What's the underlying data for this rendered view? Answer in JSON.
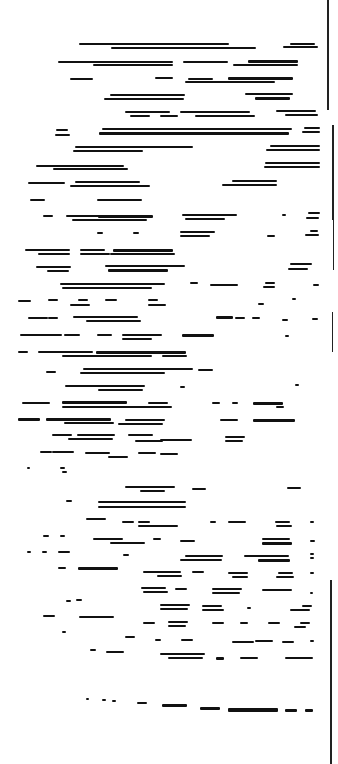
{
  "document": {
    "description": "Degraded thresholded scan of a text page; no legible characters",
    "legible_text": "",
    "ink_color": "#111111",
    "paper_color": "#ffffff"
  },
  "edge_lines": [
    {
      "x": 327,
      "y": 0,
      "w": 1.5,
      "h": 110
    },
    {
      "x": 332,
      "y": 125,
      "w": 1.5,
      "h": 95
    },
    {
      "x": 333,
      "y": 210,
      "w": 1.2,
      "h": 60
    },
    {
      "x": 332,
      "y": 312,
      "w": 1.2,
      "h": 40
    },
    {
      "x": 330,
      "y": 580,
      "w": 1.5,
      "h": 184
    }
  ],
  "segments": [
    {
      "x": 79,
      "y": 43,
      "w": 150,
      "h": 2
    },
    {
      "x": 111,
      "y": 47,
      "w": 145,
      "h": 2
    },
    {
      "x": 290,
      "y": 43,
      "w": 25,
      "h": 2
    },
    {
      "x": 283,
      "y": 46,
      "w": 35,
      "h": 2
    },
    {
      "x": 58,
      "y": 61,
      "w": 115,
      "h": 2
    },
    {
      "x": 93,
      "y": 64,
      "w": 80,
      "h": 2
    },
    {
      "x": 183,
      "y": 61,
      "w": 45,
      "h": 2
    },
    {
      "x": 248,
      "y": 60,
      "w": 50,
      "h": 3
    },
    {
      "x": 233,
      "y": 64,
      "w": 65,
      "h": 2
    },
    {
      "x": 70,
      "y": 78,
      "w": 23,
      "h": 2
    },
    {
      "x": 155,
      "y": 77,
      "w": 18,
      "h": 2
    },
    {
      "x": 188,
      "y": 78,
      "w": 25,
      "h": 2
    },
    {
      "x": 228,
      "y": 77,
      "w": 65,
      "h": 3
    },
    {
      "x": 185,
      "y": 81,
      "w": 90,
      "h": 2
    },
    {
      "x": 110,
      "y": 94,
      "w": 75,
      "h": 2
    },
    {
      "x": 104,
      "y": 98,
      "w": 80,
      "h": 2
    },
    {
      "x": 245,
      "y": 93,
      "w": 48,
      "h": 2
    },
    {
      "x": 255,
      "y": 97,
      "w": 35,
      "h": 3
    },
    {
      "x": 125,
      "y": 111,
      "w": 45,
      "h": 2
    },
    {
      "x": 130,
      "y": 115,
      "w": 20,
      "h": 2
    },
    {
      "x": 160,
      "y": 115,
      "w": 18,
      "h": 2
    },
    {
      "x": 180,
      "y": 111,
      "w": 70,
      "h": 2
    },
    {
      "x": 195,
      "y": 115,
      "w": 60,
      "h": 2
    },
    {
      "x": 276,
      "y": 110,
      "w": 40,
      "h": 2
    },
    {
      "x": 285,
      "y": 114,
      "w": 33,
      "h": 2
    },
    {
      "x": 102,
      "y": 128,
      "w": 190,
      "h": 2
    },
    {
      "x": 99,
      "y": 132,
      "w": 190,
      "h": 3
    },
    {
      "x": 56,
      "y": 129,
      "w": 12,
      "h": 2
    },
    {
      "x": 55,
      "y": 134,
      "w": 15,
      "h": 2
    },
    {
      "x": 304,
      "y": 127,
      "w": 16,
      "h": 2
    },
    {
      "x": 302,
      "y": 131,
      "w": 18,
      "h": 2
    },
    {
      "x": 75,
      "y": 146,
      "w": 118,
      "h": 2
    },
    {
      "x": 73,
      "y": 150,
      "w": 70,
      "h": 2
    },
    {
      "x": 270,
      "y": 145,
      "w": 50,
      "h": 2
    },
    {
      "x": 266,
      "y": 149,
      "w": 54,
      "h": 2
    },
    {
      "x": 36,
      "y": 165,
      "w": 88,
      "h": 2
    },
    {
      "x": 53,
      "y": 168,
      "w": 75,
      "h": 2
    },
    {
      "x": 265,
      "y": 162,
      "w": 55,
      "h": 2
    },
    {
      "x": 264,
      "y": 166,
      "w": 56,
      "h": 2
    },
    {
      "x": 28,
      "y": 182,
      "w": 37,
      "h": 2
    },
    {
      "x": 75,
      "y": 181,
      "w": 65,
      "h": 2
    },
    {
      "x": 70,
      "y": 185,
      "w": 80,
      "h": 2
    },
    {
      "x": 232,
      "y": 180,
      "w": 45,
      "h": 2
    },
    {
      "x": 222,
      "y": 184,
      "w": 55,
      "h": 2
    },
    {
      "x": 30,
      "y": 199,
      "w": 15,
      "h": 2
    },
    {
      "x": 97,
      "y": 199,
      "w": 45,
      "h": 2
    },
    {
      "x": 43,
      "y": 215,
      "w": 10,
      "h": 2
    },
    {
      "x": 66,
      "y": 215,
      "w": 35,
      "h": 2
    },
    {
      "x": 98,
      "y": 215,
      "w": 55,
      "h": 3
    },
    {
      "x": 72,
      "y": 219,
      "w": 75,
      "h": 2
    },
    {
      "x": 182,
      "y": 214,
      "w": 55,
      "h": 2
    },
    {
      "x": 185,
      "y": 218,
      "w": 40,
      "h": 2
    },
    {
      "x": 282,
      "y": 214,
      "w": 4,
      "h": 2
    },
    {
      "x": 308,
      "y": 212,
      "w": 12,
      "h": 2
    },
    {
      "x": 306,
      "y": 217,
      "w": 13,
      "h": 2
    },
    {
      "x": 97,
      "y": 232,
      "w": 6,
      "h": 2
    },
    {
      "x": 133,
      "y": 232,
      "w": 6,
      "h": 2
    },
    {
      "x": 180,
      "y": 231,
      "w": 35,
      "h": 2
    },
    {
      "x": 180,
      "y": 235,
      "w": 30,
      "h": 2
    },
    {
      "x": 267,
      "y": 235,
      "w": 8,
      "h": 2
    },
    {
      "x": 310,
      "y": 230,
      "w": 8,
      "h": 2
    },
    {
      "x": 305,
      "y": 234,
      "w": 14,
      "h": 2
    },
    {
      "x": 25,
      "y": 249,
      "w": 45,
      "h": 2
    },
    {
      "x": 38,
      "y": 253,
      "w": 32,
      "h": 2
    },
    {
      "x": 80,
      "y": 249,
      "w": 25,
      "h": 2
    },
    {
      "x": 80,
      "y": 253,
      "w": 30,
      "h": 2
    },
    {
      "x": 113,
      "y": 249,
      "w": 60,
      "h": 3
    },
    {
      "x": 110,
      "y": 253,
      "w": 65,
      "h": 2
    },
    {
      "x": 36,
      "y": 266,
      "w": 35,
      "h": 2
    },
    {
      "x": 47,
      "y": 270,
      "w": 22,
      "h": 2
    },
    {
      "x": 105,
      "y": 265,
      "w": 80,
      "h": 2
    },
    {
      "x": 108,
      "y": 269,
      "w": 60,
      "h": 3
    },
    {
      "x": 290,
      "y": 263,
      "w": 22,
      "h": 2
    },
    {
      "x": 288,
      "y": 268,
      "w": 20,
      "h": 2
    },
    {
      "x": 60,
      "y": 283,
      "w": 105,
      "h": 2
    },
    {
      "x": 62,
      "y": 287,
      "w": 90,
      "h": 2
    },
    {
      "x": 190,
      "y": 282,
      "w": 8,
      "h": 2
    },
    {
      "x": 210,
      "y": 284,
      "w": 28,
      "h": 2
    },
    {
      "x": 265,
      "y": 282,
      "w": 10,
      "h": 2
    },
    {
      "x": 263,
      "y": 286,
      "w": 12,
      "h": 2
    },
    {
      "x": 313,
      "y": 284,
      "w": 6,
      "h": 2
    },
    {
      "x": 18,
      "y": 300,
      "w": 13,
      "h": 2
    },
    {
      "x": 48,
      "y": 299,
      "w": 10,
      "h": 2
    },
    {
      "x": 78,
      "y": 299,
      "w": 10,
      "h": 2
    },
    {
      "x": 105,
      "y": 299,
      "w": 12,
      "h": 2
    },
    {
      "x": 148,
      "y": 299,
      "w": 10,
      "h": 2
    },
    {
      "x": 70,
      "y": 304,
      "w": 20,
      "h": 2
    },
    {
      "x": 148,
      "y": 304,
      "w": 18,
      "h": 2
    },
    {
      "x": 292,
      "y": 298,
      "w": 4,
      "h": 2
    },
    {
      "x": 258,
      "y": 303,
      "w": 6,
      "h": 2
    },
    {
      "x": 28,
      "y": 317,
      "w": 20,
      "h": 2
    },
    {
      "x": 48,
      "y": 317,
      "w": 10,
      "h": 2
    },
    {
      "x": 73,
      "y": 316,
      "w": 65,
      "h": 2
    },
    {
      "x": 86,
      "y": 320,
      "w": 55,
      "h": 2
    },
    {
      "x": 216,
      "y": 316,
      "w": 17,
      "h": 3
    },
    {
      "x": 235,
      "y": 317,
      "w": 10,
      "h": 2
    },
    {
      "x": 252,
      "y": 317,
      "w": 8,
      "h": 2
    },
    {
      "x": 282,
      "y": 319,
      "w": 6,
      "h": 2
    },
    {
      "x": 312,
      "y": 318,
      "w": 6,
      "h": 2
    },
    {
      "x": 20,
      "y": 334,
      "w": 42,
      "h": 2
    },
    {
      "x": 64,
      "y": 334,
      "w": 16,
      "h": 2
    },
    {
      "x": 97,
      "y": 334,
      "w": 15,
      "h": 2
    },
    {
      "x": 122,
      "y": 334,
      "w": 40,
      "h": 2
    },
    {
      "x": 182,
      "y": 334,
      "w": 32,
      "h": 3
    },
    {
      "x": 122,
      "y": 338,
      "w": 30,
      "h": 2
    },
    {
      "x": 285,
      "y": 335,
      "w": 4,
      "h": 2
    },
    {
      "x": 18,
      "y": 351,
      "w": 10,
      "h": 2
    },
    {
      "x": 38,
      "y": 351,
      "w": 55,
      "h": 2
    },
    {
      "x": 96,
      "y": 351,
      "w": 90,
      "h": 3
    },
    {
      "x": 62,
      "y": 355,
      "w": 90,
      "h": 2
    },
    {
      "x": 162,
      "y": 355,
      "w": 25,
      "h": 2
    },
    {
      "x": 46,
      "y": 371,
      "w": 10,
      "h": 2
    },
    {
      "x": 83,
      "y": 368,
      "w": 110,
      "h": 2
    },
    {
      "x": 80,
      "y": 372,
      "w": 85,
      "h": 2
    },
    {
      "x": 198,
      "y": 369,
      "w": 15,
      "h": 2
    },
    {
      "x": 65,
      "y": 385,
      "w": 80,
      "h": 2
    },
    {
      "x": 98,
      "y": 389,
      "w": 45,
      "h": 2
    },
    {
      "x": 180,
      "y": 386,
      "w": 5,
      "h": 2
    },
    {
      "x": 295,
      "y": 384,
      "w": 4,
      "h": 2
    },
    {
      "x": 22,
      "y": 402,
      "w": 28,
      "h": 2
    },
    {
      "x": 62,
      "y": 401,
      "w": 65,
      "h": 3
    },
    {
      "x": 62,
      "y": 406,
      "w": 110,
      "h": 2
    },
    {
      "x": 148,
      "y": 402,
      "w": 20,
      "h": 2
    },
    {
      "x": 212,
      "y": 402,
      "w": 8,
      "h": 2
    },
    {
      "x": 232,
      "y": 402,
      "w": 6,
      "h": 2
    },
    {
      "x": 253,
      "y": 402,
      "w": 30,
      "h": 3
    },
    {
      "x": 276,
      "y": 406,
      "w": 8,
      "h": 2
    },
    {
      "x": 18,
      "y": 418,
      "w": 22,
      "h": 3
    },
    {
      "x": 46,
      "y": 418,
      "w": 65,
      "h": 3
    },
    {
      "x": 64,
      "y": 422,
      "w": 50,
      "h": 2
    },
    {
      "x": 125,
      "y": 419,
      "w": 40,
      "h": 2
    },
    {
      "x": 118,
      "y": 423,
      "w": 45,
      "h": 2
    },
    {
      "x": 220,
      "y": 419,
      "w": 18,
      "h": 2
    },
    {
      "x": 253,
      "y": 419,
      "w": 42,
      "h": 3
    },
    {
      "x": 52,
      "y": 434,
      "w": 20,
      "h": 2
    },
    {
      "x": 77,
      "y": 434,
      "w": 38,
      "h": 2
    },
    {
      "x": 68,
      "y": 438,
      "w": 45,
      "h": 2
    },
    {
      "x": 128,
      "y": 434,
      "w": 25,
      "h": 2
    },
    {
      "x": 135,
      "y": 440,
      "w": 28,
      "h": 2
    },
    {
      "x": 160,
      "y": 439,
      "w": 32,
      "h": 2
    },
    {
      "x": 225,
      "y": 436,
      "w": 20,
      "h": 2
    },
    {
      "x": 225,
      "y": 440,
      "w": 18,
      "h": 2
    },
    {
      "x": 40,
      "y": 451,
      "w": 12,
      "h": 2
    },
    {
      "x": 52,
      "y": 451,
      "w": 22,
      "h": 2
    },
    {
      "x": 85,
      "y": 452,
      "w": 25,
      "h": 2
    },
    {
      "x": 138,
      "y": 452,
      "w": 18,
      "h": 2
    },
    {
      "x": 160,
      "y": 453,
      "w": 18,
      "h": 2
    },
    {
      "x": 108,
      "y": 456,
      "w": 20,
      "h": 2
    },
    {
      "x": 27,
      "y": 467,
      "w": 3,
      "h": 2
    },
    {
      "x": 60,
      "y": 467,
      "w": 5,
      "h": 2
    },
    {
      "x": 62,
      "y": 471,
      "w": 5,
      "h": 2
    },
    {
      "x": 125,
      "y": 486,
      "w": 50,
      "h": 2
    },
    {
      "x": 140,
      "y": 490,
      "w": 25,
      "h": 2
    },
    {
      "x": 192,
      "y": 488,
      "w": 14,
      "h": 2
    },
    {
      "x": 287,
      "y": 487,
      "w": 14,
      "h": 2
    },
    {
      "x": 66,
      "y": 500,
      "w": 6,
      "h": 2
    },
    {
      "x": 98,
      "y": 501,
      "w": 88,
      "h": 2
    },
    {
      "x": 98,
      "y": 506,
      "w": 88,
      "h": 2
    },
    {
      "x": 86,
      "y": 518,
      "w": 20,
      "h": 2
    },
    {
      "x": 122,
      "y": 521,
      "w": 12,
      "h": 2
    },
    {
      "x": 138,
      "y": 521,
      "w": 12,
      "h": 2
    },
    {
      "x": 138,
      "y": 525,
      "w": 40,
      "h": 2
    },
    {
      "x": 210,
      "y": 521,
      "w": 6,
      "h": 2
    },
    {
      "x": 228,
      "y": 521,
      "w": 18,
      "h": 2
    },
    {
      "x": 275,
      "y": 521,
      "w": 15,
      "h": 2
    },
    {
      "x": 276,
      "y": 525,
      "w": 16,
      "h": 2
    },
    {
      "x": 310,
      "y": 521,
      "w": 4,
      "h": 2
    },
    {
      "x": 43,
      "y": 535,
      "w": 6,
      "h": 2
    },
    {
      "x": 60,
      "y": 535,
      "w": 5,
      "h": 2
    },
    {
      "x": 93,
      "y": 538,
      "w": 30,
      "h": 2
    },
    {
      "x": 110,
      "y": 542,
      "w": 35,
      "h": 2
    },
    {
      "x": 153,
      "y": 538,
      "w": 8,
      "h": 2
    },
    {
      "x": 180,
      "y": 540,
      "w": 15,
      "h": 2
    },
    {
      "x": 262,
      "y": 538,
      "w": 28,
      "h": 2
    },
    {
      "x": 262,
      "y": 542,
      "w": 30,
      "h": 3
    },
    {
      "x": 310,
      "y": 540,
      "w": 5,
      "h": 2
    },
    {
      "x": 27,
      "y": 551,
      "w": 4,
      "h": 2
    },
    {
      "x": 42,
      "y": 551,
      "w": 5,
      "h": 2
    },
    {
      "x": 58,
      "y": 551,
      "w": 12,
      "h": 2
    },
    {
      "x": 123,
      "y": 554,
      "w": 6,
      "h": 2
    },
    {
      "x": 185,
      "y": 555,
      "w": 38,
      "h": 2
    },
    {
      "x": 180,
      "y": 559,
      "w": 42,
      "h": 2
    },
    {
      "x": 244,
      "y": 555,
      "w": 45,
      "h": 2
    },
    {
      "x": 258,
      "y": 559,
      "w": 32,
      "h": 3
    },
    {
      "x": 310,
      "y": 553,
      "w": 4,
      "h": 2
    },
    {
      "x": 310,
      "y": 557,
      "w": 4,
      "h": 2
    },
    {
      "x": 58,
      "y": 567,
      "w": 8,
      "h": 2
    },
    {
      "x": 78,
      "y": 567,
      "w": 40,
      "h": 3
    },
    {
      "x": 143,
      "y": 571,
      "w": 38,
      "h": 2
    },
    {
      "x": 157,
      "y": 575,
      "w": 25,
      "h": 2
    },
    {
      "x": 192,
      "y": 571,
      "w": 12,
      "h": 2
    },
    {
      "x": 228,
      "y": 572,
      "w": 20,
      "h": 2
    },
    {
      "x": 232,
      "y": 576,
      "w": 16,
      "h": 2
    },
    {
      "x": 278,
      "y": 572,
      "w": 15,
      "h": 2
    },
    {
      "x": 276,
      "y": 576,
      "w": 18,
      "h": 2
    },
    {
      "x": 310,
      "y": 572,
      "w": 4,
      "h": 2
    },
    {
      "x": 141,
      "y": 587,
      "w": 25,
      "h": 2
    },
    {
      "x": 143,
      "y": 591,
      "w": 25,
      "h": 2
    },
    {
      "x": 175,
      "y": 588,
      "w": 12,
      "h": 2
    },
    {
      "x": 212,
      "y": 588,
      "w": 30,
      "h": 2
    },
    {
      "x": 212,
      "y": 592,
      "w": 28,
      "h": 2
    },
    {
      "x": 262,
      "y": 589,
      "w": 30,
      "h": 2
    },
    {
      "x": 310,
      "y": 592,
      "w": 3,
      "h": 2
    },
    {
      "x": 66,
      "y": 600,
      "w": 5,
      "h": 2
    },
    {
      "x": 76,
      "y": 599,
      "w": 6,
      "h": 2
    },
    {
      "x": 160,
      "y": 604,
      "w": 30,
      "h": 2
    },
    {
      "x": 160,
      "y": 608,
      "w": 28,
      "h": 2
    },
    {
      "x": 202,
      "y": 605,
      "w": 20,
      "h": 2
    },
    {
      "x": 202,
      "y": 609,
      "w": 22,
      "h": 2
    },
    {
      "x": 247,
      "y": 607,
      "w": 4,
      "h": 2
    },
    {
      "x": 290,
      "y": 609,
      "w": 20,
      "h": 2
    },
    {
      "x": 302,
      "y": 605,
      "w": 10,
      "h": 2
    },
    {
      "x": 43,
      "y": 615,
      "w": 12,
      "h": 2
    },
    {
      "x": 79,
      "y": 616,
      "w": 35,
      "h": 2
    },
    {
      "x": 143,
      "y": 622,
      "w": 12,
      "h": 2
    },
    {
      "x": 168,
      "y": 621,
      "w": 20,
      "h": 2
    },
    {
      "x": 168,
      "y": 625,
      "w": 18,
      "h": 2
    },
    {
      "x": 212,
      "y": 622,
      "w": 12,
      "h": 2
    },
    {
      "x": 240,
      "y": 622,
      "w": 8,
      "h": 2
    },
    {
      "x": 268,
      "y": 622,
      "w": 12,
      "h": 2
    },
    {
      "x": 300,
      "y": 622,
      "w": 10,
      "h": 2
    },
    {
      "x": 294,
      "y": 626,
      "w": 12,
      "h": 2
    },
    {
      "x": 62,
      "y": 631,
      "w": 4,
      "h": 2
    },
    {
      "x": 125,
      "y": 636,
      "w": 10,
      "h": 2
    },
    {
      "x": 155,
      "y": 639,
      "w": 6,
      "h": 2
    },
    {
      "x": 181,
      "y": 639,
      "w": 12,
      "h": 2
    },
    {
      "x": 232,
      "y": 641,
      "w": 22,
      "h": 2
    },
    {
      "x": 255,
      "y": 640,
      "w": 18,
      "h": 2
    },
    {
      "x": 282,
      "y": 641,
      "w": 12,
      "h": 2
    },
    {
      "x": 310,
      "y": 640,
      "w": 4,
      "h": 2
    },
    {
      "x": 90,
      "y": 649,
      "w": 6,
      "h": 2
    },
    {
      "x": 106,
      "y": 651,
      "w": 18,
      "h": 2
    },
    {
      "x": 160,
      "y": 653,
      "w": 45,
      "h": 2
    },
    {
      "x": 168,
      "y": 657,
      "w": 35,
      "h": 2
    },
    {
      "x": 216,
      "y": 657,
      "w": 8,
      "h": 3
    },
    {
      "x": 240,
      "y": 657,
      "w": 18,
      "h": 2
    },
    {
      "x": 285,
      "y": 657,
      "w": 28,
      "h": 2
    },
    {
      "x": 86,
      "y": 698,
      "w": 3,
      "h": 2
    },
    {
      "x": 102,
      "y": 699,
      "w": 4,
      "h": 2
    },
    {
      "x": 112,
      "y": 700,
      "w": 4,
      "h": 2
    },
    {
      "x": 137,
      "y": 702,
      "w": 10,
      "h": 2
    },
    {
      "x": 162,
      "y": 704,
      "w": 25,
      "h": 3
    },
    {
      "x": 200,
      "y": 707,
      "w": 20,
      "h": 3
    },
    {
      "x": 228,
      "y": 708,
      "w": 50,
      "h": 4
    },
    {
      "x": 285,
      "y": 709,
      "w": 12,
      "h": 3
    },
    {
      "x": 305,
      "y": 709,
      "w": 8,
      "h": 3
    }
  ]
}
